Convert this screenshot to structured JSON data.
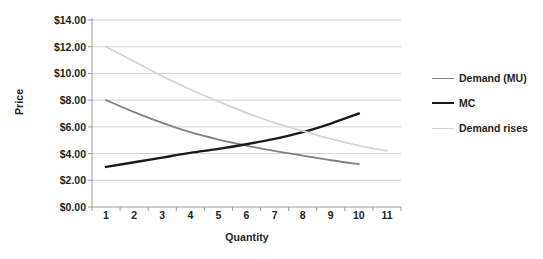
{
  "chart_data": {
    "type": "line",
    "title": "",
    "xlabel": "Quantity",
    "ylabel": "Price",
    "x": [
      1,
      2,
      3,
      4,
      5,
      6,
      7,
      8,
      9,
      10,
      11
    ],
    "xticklabels": [
      "1",
      "2",
      "3",
      "4",
      "5",
      "6",
      "7",
      "8",
      "9",
      "10",
      "11"
    ],
    "yticks": [
      0,
      2,
      4,
      6,
      8,
      10,
      12,
      14
    ],
    "yticklabels": [
      "$0.00",
      "$2.00",
      "$4.00",
      "$6.00",
      "$8.00",
      "$10.00",
      "$12.00",
      "$14.00"
    ],
    "ylim": [
      0,
      14
    ],
    "grid": "horizontal",
    "legend_position": "right",
    "series": [
      {
        "name": "Demand (MU)",
        "color": "#808080",
        "width": 1.8,
        "x": [
          1,
          2,
          3,
          4,
          5,
          6,
          7,
          8,
          9,
          10
        ],
        "values": [
          8.0,
          7.1,
          6.3,
          5.6,
          5.05,
          4.6,
          4.2,
          3.85,
          3.5,
          3.2
        ]
      },
      {
        "name": "MC",
        "color": "#1a1a1a",
        "width": 2.4,
        "x": [
          1,
          2,
          3,
          4,
          5,
          6,
          7,
          8,
          9,
          10
        ],
        "values": [
          3.0,
          3.35,
          3.7,
          4.05,
          4.35,
          4.7,
          5.1,
          5.6,
          6.25,
          7.0
        ]
      },
      {
        "name": "Demand rises",
        "color": "#d4d4d4",
        "width": 1.8,
        "x": [
          1,
          2,
          3,
          4,
          5,
          6,
          7,
          8,
          9,
          10,
          11
        ],
        "values": [
          12.0,
          10.9,
          9.8,
          8.8,
          7.9,
          7.05,
          6.3,
          5.7,
          5.1,
          4.6,
          4.2
        ]
      }
    ],
    "annotations": []
  },
  "legend": {
    "items": [
      {
        "label": "Demand (MU)"
      },
      {
        "label": "MC"
      },
      {
        "label": "Demand rises"
      }
    ]
  }
}
